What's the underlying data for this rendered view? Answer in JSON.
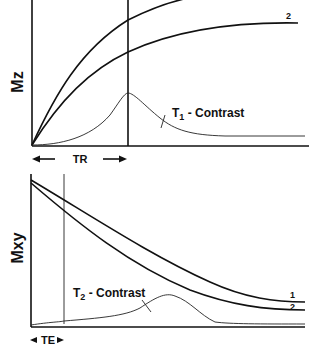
{
  "top_panel": {
    "y_label": "Mz",
    "interval_label": "TR",
    "contrast_label_main": "T",
    "contrast_label_sub": "1",
    "contrast_label_rest": " - Contrast",
    "curve_labels": [
      "2"
    ]
  },
  "bottom_panel": {
    "y_label": "Mxy",
    "interval_label": "TE",
    "contrast_label_main": "T",
    "contrast_label_sub": "2",
    "contrast_label_rest": " - Contrast",
    "curve_labels": [
      "1",
      "2"
    ]
  }
}
